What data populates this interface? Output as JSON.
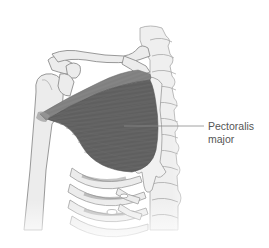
{
  "figure": {
    "label": {
      "line1": "Pectoralis",
      "line2": "major"
    },
    "colors": {
      "muscle_dark": "#5e5e5e",
      "muscle_mid": "#727272",
      "muscle_clavicular": "#8a8a8a",
      "bone_fill": "#ececec",
      "bone_stroke": "#9a9a9a",
      "leader_line": "#8a8a8a",
      "label_text": "#555555"
    }
  }
}
